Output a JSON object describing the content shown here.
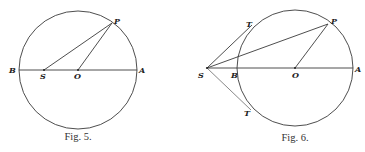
{
  "figures": [
    {
      "id": "fig5",
      "caption": "Fig. 5.",
      "circle": {
        "cx": 78,
        "cy": 70,
        "r": 59
      },
      "points": {
        "B": {
          "label": "B",
          "x": 19,
          "y": 70
        },
        "S": {
          "label": "S",
          "x": 44,
          "y": 70
        },
        "O": {
          "label": "O",
          "x": 78,
          "y": 70
        },
        "A": {
          "label": "A",
          "x": 137,
          "y": 70
        },
        "P": {
          "label": "P",
          "x": 112,
          "y": 23
        }
      },
      "segments": [
        [
          "B",
          "A"
        ],
        [
          "S",
          "P"
        ],
        [
          "O",
          "P"
        ]
      ]
    },
    {
      "id": "fig6",
      "caption": "Fig. 6.",
      "circle": {
        "cx": 295,
        "cy": 68,
        "r": 58
      },
      "points": {
        "S": {
          "label": "S",
          "x": 207,
          "y": 68
        },
        "B": {
          "label": "B",
          "x": 237,
          "y": 68
        },
        "O": {
          "label": "O",
          "x": 295,
          "y": 68
        },
        "A": {
          "label": "A",
          "x": 353,
          "y": 68
        },
        "P": {
          "label": "P",
          "x": 328,
          "y": 24
        },
        "T1": {
          "label": "T",
          "x": 250,
          "y": 27
        },
        "T2": {
          "label": "T",
          "x": 249,
          "y": 108
        }
      },
      "segments": [
        [
          "S",
          "A"
        ],
        [
          "S",
          "P"
        ],
        [
          "O",
          "P"
        ],
        [
          "S",
          "T1"
        ],
        [
          "S",
          "T2"
        ]
      ]
    }
  ]
}
